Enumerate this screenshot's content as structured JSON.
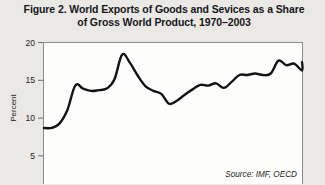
{
  "title": {
    "line1": "Figure 2. World Exports of Goods and Sevices as a Share",
    "line2": "of Gross World Product, 1970–2003"
  },
  "source_note": "Source: IMF, OECD",
  "axis": {
    "y_label": "Percent",
    "y_ticks": [
      "20",
      "15",
      "10",
      "5"
    ]
  },
  "colors": {
    "background": "#ebe9e6",
    "plot_background": "#fdfdfc",
    "line": "#131315",
    "frame": "#8d8d8d",
    "text": "#16161a"
  },
  "chart_data": {
    "type": "line",
    "title": "Figure 2. World Exports of Goods and Sevices as a Share of Gross World Product, 1970–2003",
    "xlabel": "",
    "ylabel": "Percent",
    "ylim": [
      0,
      20
    ],
    "xlim": [
      1970,
      2003
    ],
    "grid": false,
    "legend": "none",
    "source": "Source: IMF, OECD",
    "x": [
      1970,
      1971,
      1972,
      1973,
      1974,
      1975,
      1976,
      1977,
      1978,
      1979,
      1980,
      1981,
      1982,
      1983,
      1984,
      1985,
      1986,
      1987,
      1988,
      1989,
      1990,
      1991,
      1992,
      1993,
      1994,
      1995,
      1996,
      1997,
      1998,
      1999,
      2000,
      2001,
      2002,
      2003
    ],
    "y": [
      8.7,
      8.7,
      9.3,
      11.1,
      14.3,
      13.9,
      13.6,
      13.7,
      13.9,
      15.1,
      18.4,
      17.3,
      15.6,
      14.2,
      13.6,
      13.2,
      11.9,
      12.3,
      13.1,
      13.8,
      14.4,
      14.3,
      14.6,
      14.0,
      14.8,
      15.7,
      15.7,
      15.9,
      15.7,
      15.9,
      17.6,
      17.0,
      17.2,
      16.3
    ],
    "series": [
      {
        "name": "World exports of goods and services as share of gross world product",
        "values": [
          8.7,
          8.7,
          9.3,
          11.1,
          14.3,
          13.9,
          13.6,
          13.7,
          13.9,
          15.1,
          18.4,
          17.3,
          15.6,
          14.2,
          13.6,
          13.2,
          11.9,
          12.3,
          13.1,
          13.8,
          14.4,
          14.3,
          14.6,
          14.0,
          14.8,
          15.7,
          15.7,
          15.9,
          15.7,
          15.9,
          17.6,
          17.0,
          17.2,
          16.3
        ],
        "units": "percent"
      }
    ],
    "yticks": [
      5,
      10,
      15,
      20
    ],
    "final_value": 17.4
  }
}
